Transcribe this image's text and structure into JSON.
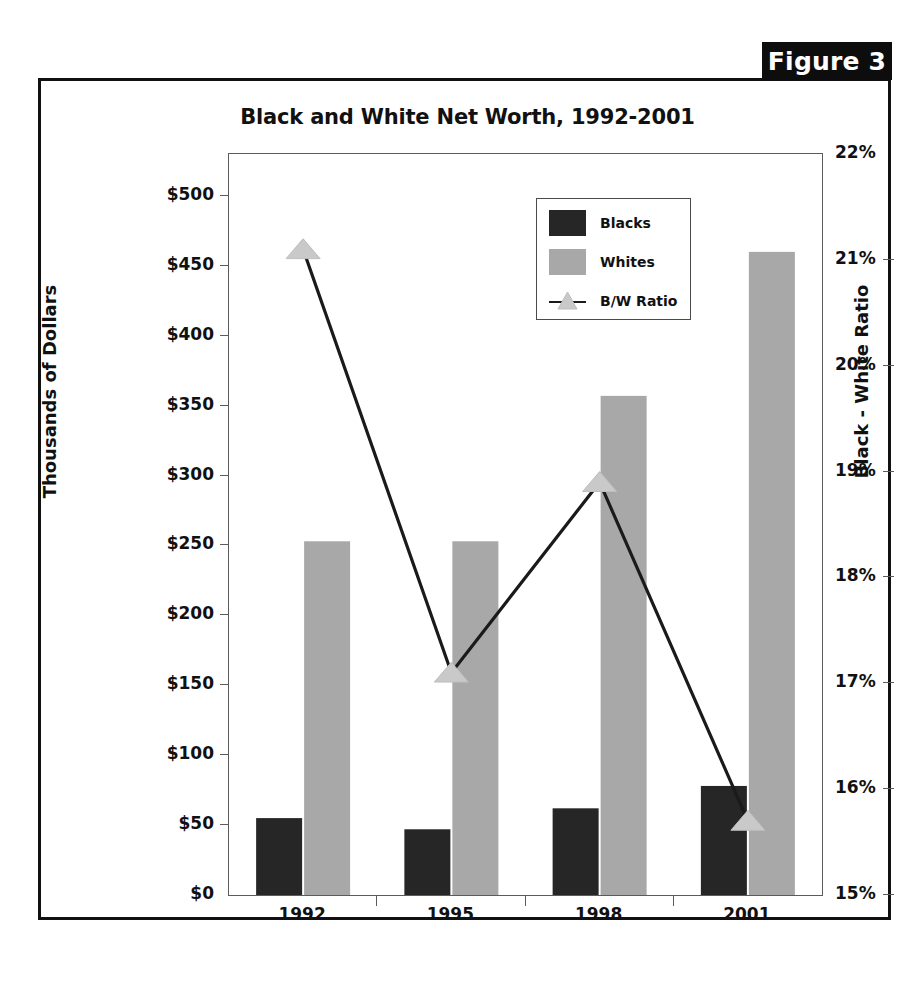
{
  "figure": {
    "badge_label": "Figure 3"
  },
  "chart_data": {
    "type": "bar",
    "title": "Black and White Net Worth, 1992-2001",
    "categories": [
      "1992",
      "1995",
      "1998",
      "2001"
    ],
    "xlabel": "",
    "ylabel": "Thousands of Dollars",
    "y2label": "Black - White Ratio",
    "ylim": [
      0,
      530
    ],
    "y2lim": [
      15,
      22
    ],
    "grid": false,
    "legend_position": "upper-center",
    "y_ticks": [
      "$0",
      "$50",
      "$100",
      "$150",
      "$200",
      "$250",
      "$300",
      "$350",
      "$400",
      "$450",
      "$500"
    ],
    "y_tick_values": [
      0,
      50,
      100,
      150,
      200,
      250,
      300,
      350,
      400,
      450,
      500
    ],
    "y2_ticks": [
      "15%",
      "16%",
      "17%",
      "18%",
      "19%",
      "20%",
      "21%",
      "22%"
    ],
    "y2_tick_values": [
      15,
      16,
      17,
      18,
      19,
      20,
      21,
      22
    ],
    "series": [
      {
        "name": "Blacks",
        "kind": "bar",
        "axis": "left",
        "color": "#262626",
        "values": [
          55,
          47,
          62,
          78
        ]
      },
      {
        "name": "Whites",
        "kind": "bar",
        "axis": "left",
        "color": "#a8a8a8",
        "values": [
          253,
          253,
          357,
          460
        ]
      },
      {
        "name": "B/W Ratio",
        "kind": "line",
        "axis": "right",
        "color": "#1a1a1a",
        "marker": "triangle",
        "marker_color": "#c9c9c9",
        "values": [
          21.1,
          17.1,
          18.9,
          15.7
        ]
      }
    ],
    "legend_entries": [
      "Blacks",
      "Whites",
      "B/W Ratio"
    ]
  },
  "colors": {
    "blacks_bar": "#262626",
    "whites_bar": "#a8a8a8",
    "ratio_line": "#1a1a1a",
    "ratio_marker": "#c9c9c9",
    "frame": "#111111",
    "badge_bg": "#0d0d0d"
  }
}
